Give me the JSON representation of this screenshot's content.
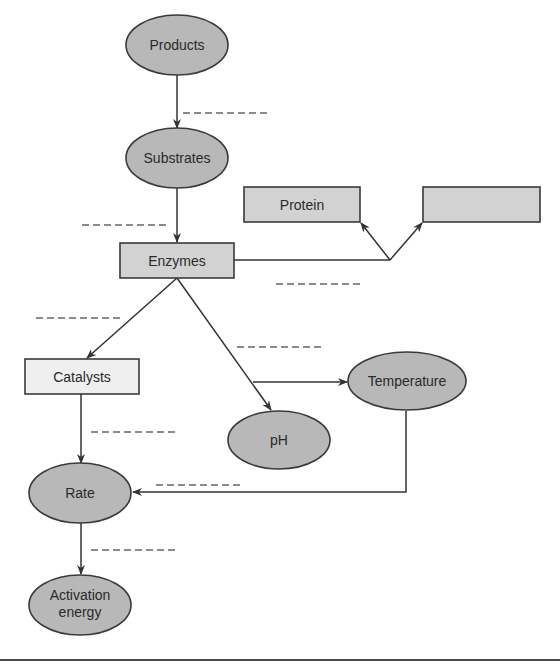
{
  "diagram": {
    "type": "concept-map",
    "nodes": {
      "products": {
        "label": "Products",
        "shape": "ellipse"
      },
      "substrates": {
        "label": "Substrates",
        "shape": "ellipse"
      },
      "enzymes": {
        "label": "Enzymes",
        "shape": "box"
      },
      "protein": {
        "label": "Protein",
        "shape": "box"
      },
      "blank_box": {
        "label": "",
        "shape": "box"
      },
      "catalysts": {
        "label": "Catalysts",
        "shape": "box"
      },
      "temperature": {
        "label": "Temperature",
        "shape": "ellipse"
      },
      "ph": {
        "label": "pH",
        "shape": "ellipse"
      },
      "rate": {
        "label": "Rate",
        "shape": "ellipse"
      },
      "activation_energy": {
        "label_line1": "Activation",
        "label_line2": "energy",
        "shape": "ellipse"
      }
    },
    "edges": [
      {
        "from": "products",
        "to": "substrates",
        "link_label": ""
      },
      {
        "from": "substrates",
        "to": "enzymes",
        "link_label": ""
      },
      {
        "from": "enzymes",
        "to": "protein",
        "link_label": ""
      },
      {
        "from": "enzymes",
        "to": "blank_box",
        "link_label": ""
      },
      {
        "from": "enzymes",
        "to": "catalysts",
        "link_label": ""
      },
      {
        "from": "enzymes",
        "to": "ph",
        "link_label": ""
      },
      {
        "from": "enzymes",
        "to": "temperature",
        "link_label": ""
      },
      {
        "from": "catalysts",
        "to": "rate",
        "link_label": ""
      },
      {
        "from": "temperature",
        "to": "rate",
        "link_label": ""
      },
      {
        "from": "rate",
        "to": "activation_energy",
        "link_label": ""
      }
    ],
    "colors": {
      "ellipse_fill": "#b8b8b8",
      "box_fill": "#d2d2d2",
      "catalysts_fill": "#efefef",
      "stroke": "#3a3a3a"
    }
  }
}
